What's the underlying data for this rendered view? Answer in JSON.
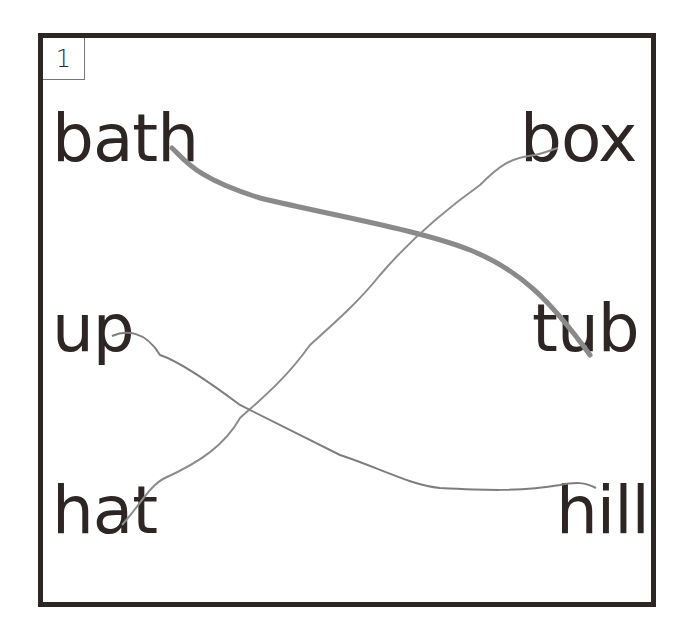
{
  "exercise": {
    "number": "1",
    "left_words": [
      "bath",
      "up",
      "hat"
    ],
    "right_words": [
      "box",
      "tub",
      "hill"
    ],
    "matches": [
      {
        "from": "bath",
        "to": "tub",
        "stroke": "#8a8a8a",
        "width": 5
      },
      {
        "from": "hat",
        "to": "box",
        "stroke": "#8c8c8c",
        "width": 2
      },
      {
        "from": "up",
        "to": "hill",
        "stroke": "#7e7e7e",
        "width": 2
      }
    ],
    "colors": {
      "border": "#2e2624",
      "text": "#2e2624",
      "line": "#888888"
    }
  }
}
